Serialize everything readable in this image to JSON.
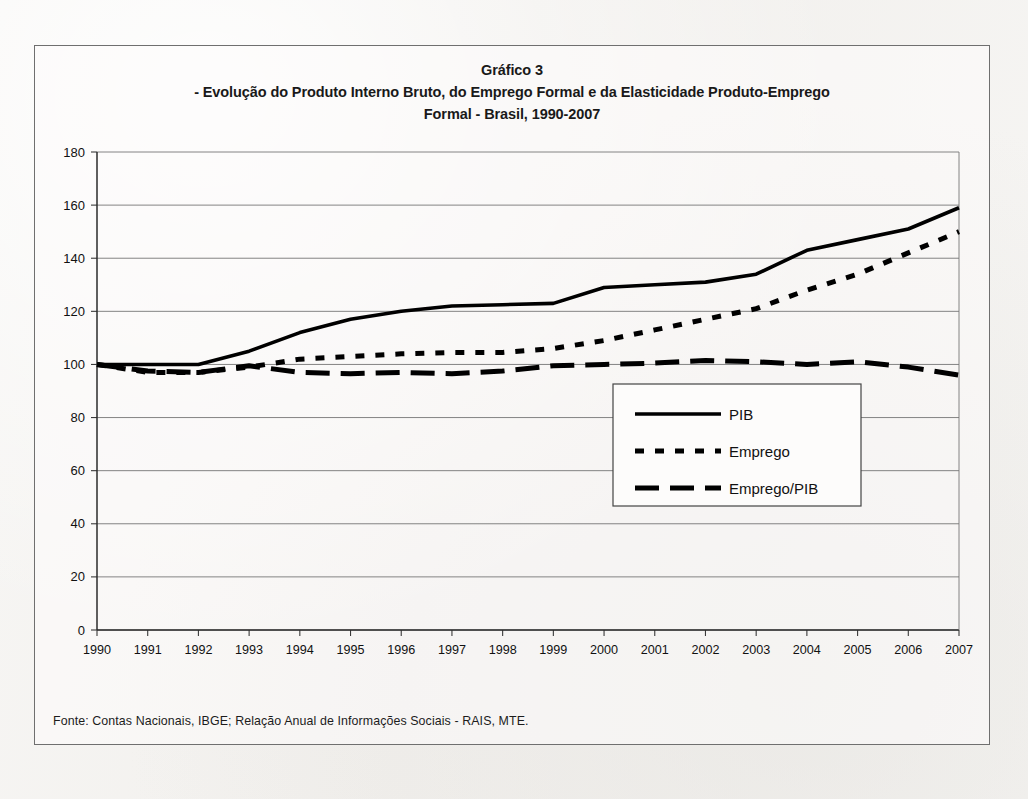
{
  "figure": {
    "title_line1": "Gráfico 3",
    "title_line2": "- Evolução do Produto Interno Bruto, do Emprego Formal e da Elasticidade Produto-Emprego",
    "title_line3": "Formal - Brasil, 1990-2007",
    "source_note": "Fonte: Contas Nacionais, IBGE; Relação Anual de Informações Sociais - RAIS, MTE."
  },
  "chart_data": {
    "type": "line",
    "title": "Gráfico 3 - Evolução do Produto Interno Bruto, do Emprego Formal e da Elasticidade Produto-Emprego Formal - Brasil, 1990-2007",
    "xlabel": "",
    "ylabel": "",
    "x": [
      1990,
      1991,
      1992,
      1993,
      1994,
      1995,
      1996,
      1997,
      1998,
      1999,
      2000,
      2001,
      2002,
      2003,
      2004,
      2005,
      2006,
      2007
    ],
    "categories": [
      "1990",
      "1991",
      "1992",
      "1993",
      "1994",
      "1995",
      "1996",
      "1997",
      "1998",
      "1999",
      "2000",
      "2001",
      "2002",
      "2003",
      "2004",
      "2005",
      "2006",
      "2007"
    ],
    "ylim": [
      0,
      180
    ],
    "yticks": [
      0,
      20,
      40,
      60,
      80,
      100,
      120,
      140,
      160,
      180
    ],
    "grid": true,
    "legend_position": "center-right",
    "series": [
      {
        "name": "PIB",
        "style": "solid",
        "color": "#000000",
        "values": [
          100,
          100,
          100,
          105,
          112,
          117,
          120,
          122,
          122.5,
          123,
          129,
          130,
          131,
          134,
          143,
          147,
          151,
          159
        ]
      },
      {
        "name": "Emprego",
        "style": "dotted",
        "color": "#000000",
        "values": [
          100,
          97,
          97,
          99,
          102,
          103,
          104,
          104.5,
          104.5,
          106,
          109,
          113,
          117,
          121,
          128,
          134,
          142,
          150
        ]
      },
      {
        "name": "Emprego/PIB",
        "style": "dashed",
        "color": "#000000",
        "values": [
          100,
          97.5,
          97,
          99.5,
          97,
          96.5,
          97,
          96.5,
          97.5,
          99.5,
          100,
          100.5,
          101.5,
          101,
          100,
          101,
          99,
          96
        ]
      }
    ]
  },
  "legend": {
    "items": [
      {
        "label": "PIB",
        "style": "solid"
      },
      {
        "label": "Emprego",
        "style": "dotted"
      },
      {
        "label": "Emprego/PIB",
        "style": "dashed"
      }
    ]
  }
}
